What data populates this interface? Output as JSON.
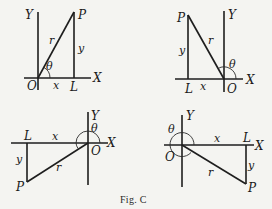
{
  "figure": {
    "caption": "Fig. C",
    "colors": {
      "ink": "#1e1e1e",
      "background": "#f4f4f1"
    }
  },
  "panels": [
    {
      "id": "quadrant-1",
      "labels": {
        "Y": "Y",
        "X": "X",
        "O": "O",
        "P": "P",
        "L": "L",
        "r": "r",
        "x": "x",
        "y": "y",
        "theta": "θ"
      }
    },
    {
      "id": "quadrant-2",
      "labels": {
        "Y": "Y",
        "X": "X",
        "O": "O",
        "P": "P",
        "L": "L",
        "r": "r",
        "x": "x",
        "y": "y",
        "theta": "θ"
      }
    },
    {
      "id": "quadrant-3",
      "labels": {
        "Y": "Y",
        "X": "X",
        "O": "O",
        "P": "P",
        "L": "L",
        "r": "r",
        "x": "x",
        "y": "y",
        "theta": "θ"
      }
    },
    {
      "id": "quadrant-4",
      "labels": {
        "Y": "Y",
        "X": "X",
        "O": "O",
        "P": "P",
        "L": "L",
        "r": "r",
        "x": "x",
        "y": "y",
        "theta": "θ"
      }
    }
  ]
}
